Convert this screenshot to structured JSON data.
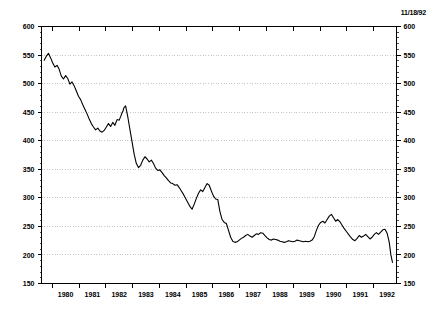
{
  "annotation": {
    "date_stamp": "11/18/92"
  },
  "chart_data": {
    "type": "line",
    "title": "",
    "subtitle": "",
    "xlabel": "",
    "ylabel": "",
    "ylim": [
      150,
      600
    ],
    "xlim": [
      1979.6,
      1992.85
    ],
    "y_ticks": [
      150,
      200,
      250,
      300,
      350,
      400,
      450,
      500,
      550,
      600
    ],
    "y_tick_labels": [
      "150",
      "200",
      "250",
      "300",
      "350",
      "400",
      "450",
      "500",
      "550",
      "600"
    ],
    "y_minor_step": 10,
    "x_ticks": [
      1980,
      1981,
      1982,
      1983,
      1984,
      1985,
      1986,
      1987,
      1988,
      1989,
      1990,
      1991,
      1992
    ],
    "x_tick_labels": [
      "1980",
      "1981",
      "1982",
      "1983",
      "1984",
      "1985",
      "1986",
      "1987",
      "1988",
      "1989",
      "1990",
      "1991",
      "1992"
    ],
    "grid": true,
    "grid_axis": "y",
    "grid_color": "#b9b9b9",
    "grid_style": "dotted",
    "legend": false,
    "legend_position": "none",
    "right_axis_mirrored": true,
    "line_color": "#000000",
    "line_width": 1.1,
    "background": "#ffffff",
    "series": [
      {
        "name": "series-1",
        "x": [
          1979.7,
          1979.78,
          1979.86,
          1979.94,
          1980.02,
          1980.1,
          1980.18,
          1980.26,
          1980.34,
          1980.42,
          1980.5,
          1980.58,
          1980.66,
          1980.74,
          1980.82,
          1980.9,
          1980.98,
          1981.06,
          1981.14,
          1981.22,
          1981.3,
          1981.38,
          1981.46,
          1981.54,
          1981.62,
          1981.7,
          1981.78,
          1981.86,
          1981.94,
          1982.02,
          1982.1,
          1982.18,
          1982.26,
          1982.34,
          1982.42,
          1982.5,
          1982.56,
          1982.6,
          1982.64,
          1982.68,
          1982.74,
          1982.82,
          1982.9,
          1982.98,
          1983.06,
          1983.14,
          1983.22,
          1983.3,
          1983.38,
          1983.46,
          1983.54,
          1983.62,
          1983.7,
          1983.78,
          1983.86,
          1983.94,
          1984.02,
          1984.1,
          1984.18,
          1984.26,
          1984.34,
          1984.42,
          1984.5,
          1984.58,
          1984.66,
          1984.74,
          1984.82,
          1984.9,
          1984.98,
          1985.06,
          1985.14,
          1985.22,
          1985.3,
          1985.38,
          1985.46,
          1985.54,
          1985.62,
          1985.7,
          1985.78,
          1985.86,
          1985.94,
          1986.02,
          1986.1,
          1986.18,
          1986.26,
          1986.34,
          1986.42,
          1986.5,
          1986.58,
          1986.66,
          1986.74,
          1986.82,
          1986.9,
          1986.98,
          1987.06,
          1987.14,
          1987.22,
          1987.3,
          1987.38,
          1987.46,
          1987.54,
          1987.62,
          1987.7,
          1987.78,
          1987.86,
          1987.94,
          1988.02,
          1988.1,
          1988.18,
          1988.26,
          1988.34,
          1988.42,
          1988.5,
          1988.58,
          1988.66,
          1988.74,
          1988.82,
          1988.9,
          1988.98,
          1989.06,
          1989.14,
          1989.22,
          1989.3,
          1989.38,
          1989.46,
          1989.54,
          1989.62,
          1989.7,
          1989.78,
          1989.86,
          1989.94,
          1990.02,
          1990.1,
          1990.18,
          1990.26,
          1990.34,
          1990.42,
          1990.5,
          1990.58,
          1990.66,
          1990.74,
          1990.82,
          1990.9,
          1990.98,
          1991.06,
          1991.14,
          1991.22,
          1991.3,
          1991.38,
          1991.46,
          1991.54,
          1991.62,
          1991.7,
          1991.78,
          1991.86,
          1991.94,
          1992.02,
          1992.1,
          1992.18,
          1992.26,
          1992.34,
          1992.42,
          1992.5,
          1992.58,
          1992.64,
          1992.7
        ],
        "values": [
          541,
          548,
          553,
          545,
          536,
          529,
          532,
          525,
          513,
          508,
          514,
          509,
          499,
          503,
          496,
          487,
          478,
          472,
          463,
          455,
          447,
          438,
          430,
          424,
          419,
          422,
          417,
          415,
          418,
          424,
          430,
          425,
          432,
          427,
          437,
          436,
          443,
          448,
          452,
          458,
          461,
          442,
          420,
          398,
          376,
          360,
          353,
          357,
          366,
          372,
          368,
          363,
          366,
          360,
          352,
          348,
          349,
          344,
          339,
          335,
          330,
          326,
          325,
          322,
          323,
          318,
          312,
          306,
          299,
          292,
          285,
          280,
          289,
          299,
          308,
          314,
          311,
          318,
          325,
          322,
          312,
          303,
          298,
          297,
          276,
          262,
          257,
          255,
          243,
          231,
          224,
          222,
          223,
          226,
          229,
          231,
          234,
          236,
          233,
          231,
          234,
          237,
          236,
          239,
          238,
          234,
          230,
          227,
          226,
          228,
          227,
          226,
          224,
          223,
          222,
          223,
          225,
          224,
          223,
          224,
          226,
          225,
          224,
          223,
          224,
          223,
          224,
          226,
          232,
          243,
          252,
          257,
          259,
          256,
          262,
          268,
          271,
          265,
          259,
          262,
          258,
          252,
          246,
          241,
          236,
          231,
          227,
          225,
          229,
          234,
          231,
          233,
          236,
          232,
          228,
          231,
          236,
          239,
          236,
          240,
          244,
          245,
          238,
          222,
          200,
          187
        ]
      }
    ]
  }
}
